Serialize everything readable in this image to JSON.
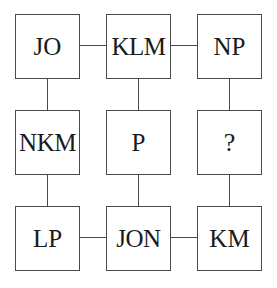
{
  "diagram": {
    "type": "3x3-box-grid",
    "background_color": "#ffffff",
    "border_color": "#4a4a4a",
    "text_color": "#1a1a1a",
    "cells": [
      {
        "id": "r1c1",
        "label": "JO",
        "row": 1,
        "col": 1,
        "x": 15,
        "y": 14,
        "is_unknown": false
      },
      {
        "id": "r1c2",
        "label": "KLM",
        "row": 1,
        "col": 2,
        "x": 106,
        "y": 14,
        "is_unknown": false
      },
      {
        "id": "r1c3",
        "label": "NP",
        "row": 1,
        "col": 3,
        "x": 197,
        "y": 14,
        "is_unknown": false
      },
      {
        "id": "r2c1",
        "label": "NKM",
        "row": 2,
        "col": 1,
        "x": 15,
        "y": 110,
        "is_unknown": false
      },
      {
        "id": "r2c2",
        "label": "P",
        "row": 2,
        "col": 2,
        "x": 106,
        "y": 110,
        "is_unknown": false
      },
      {
        "id": "r2c3",
        "label": "?",
        "row": 2,
        "col": 3,
        "x": 197,
        "y": 110,
        "is_unknown": true
      },
      {
        "id": "r3c1",
        "label": "LP",
        "row": 3,
        "col": 1,
        "x": 15,
        "y": 206,
        "is_unknown": false
      },
      {
        "id": "r3c2",
        "label": "JON",
        "row": 3,
        "col": 2,
        "x": 106,
        "y": 206,
        "is_unknown": false
      },
      {
        "id": "r3c3",
        "label": "KM",
        "row": 3,
        "col": 3,
        "x": 197,
        "y": 206,
        "is_unknown": false
      }
    ],
    "connectors": [
      {
        "id": "h-r1-c1-c2",
        "orientation": "horizontal",
        "from": "r1c1",
        "to": "r1c2"
      },
      {
        "id": "h-r1-c2-c3",
        "orientation": "horizontal",
        "from": "r1c2",
        "to": "r1c3"
      },
      {
        "id": "h-r3-c1-c2",
        "orientation": "horizontal",
        "from": "r3c1",
        "to": "r3c2"
      },
      {
        "id": "h-r3-c2-c3",
        "orientation": "horizontal",
        "from": "r3c2",
        "to": "r3c3"
      },
      {
        "id": "v-c1-r1-r2",
        "orientation": "vertical",
        "from": "r1c1",
        "to": "r2c1"
      },
      {
        "id": "v-c1-r2-r3",
        "orientation": "vertical",
        "from": "r2c1",
        "to": "r3c1"
      },
      {
        "id": "v-c2-r1-r2",
        "orientation": "vertical",
        "from": "r1c2",
        "to": "r2c2"
      },
      {
        "id": "v-c2-r2-r3",
        "orientation": "vertical",
        "from": "r2c2",
        "to": "r3c2"
      },
      {
        "id": "v-c3-r1-r2",
        "orientation": "vertical",
        "from": "r1c3",
        "to": "r2c3"
      },
      {
        "id": "v-c3-r2-r3",
        "orientation": "vertical",
        "from": "r2c3",
        "to": "r3c3"
      }
    ]
  }
}
